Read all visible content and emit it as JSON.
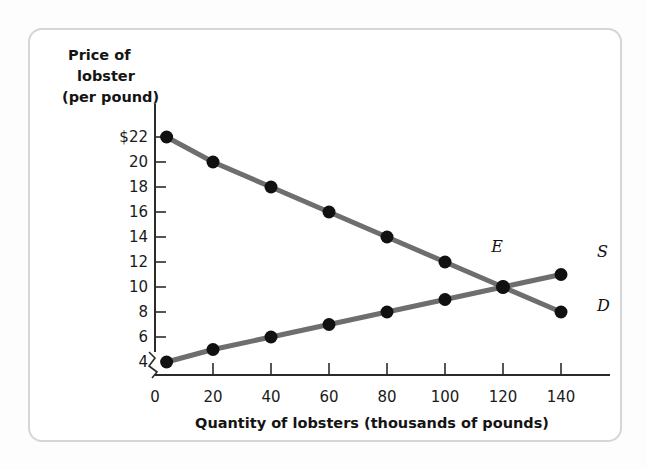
{
  "figure": {
    "background_color": "#ffffff",
    "frame_color": "#d6d6d6"
  },
  "chart_data": {
    "type": "line",
    "title": "",
    "xlabel": "Quantity of lobsters (thousands of pounds)",
    "ylabel": "Price of lobster (per pound)",
    "ylabel_lines": [
      "Price of",
      "lobster",
      "(per pound)"
    ],
    "xlim": [
      0,
      150
    ],
    "ylim": [
      3,
      23
    ],
    "grid": false,
    "axis_break_y": true,
    "legend_position": "inline-right",
    "x_ticks": [
      0,
      20,
      40,
      60,
      80,
      100,
      120,
      140
    ],
    "x_tick_labels": [
      "0",
      "20",
      "40",
      "60",
      "80",
      "100",
      "120",
      "140"
    ],
    "y_ticks": [
      4,
      6,
      8,
      10,
      12,
      14,
      16,
      18,
      20,
      22
    ],
    "y_tick_labels": [
      "4",
      "6",
      "8",
      "10",
      "12",
      "14",
      "16",
      "18",
      "20",
      "$22"
    ],
    "line_color": "#6e6e6e",
    "marker_color": "#111111",
    "series": [
      {
        "name": "D",
        "label": "D",
        "description": "Demand curve",
        "x": [
          4,
          20,
          40,
          60,
          80,
          100,
          120,
          140
        ],
        "values": [
          22,
          20,
          18,
          16,
          14,
          12,
          10,
          8
        ]
      },
      {
        "name": "S",
        "label": "S",
        "description": "Supply curve",
        "x": [
          4,
          20,
          40,
          60,
          80,
          100,
          120,
          140
        ],
        "values": [
          4,
          5,
          6,
          7,
          8,
          9,
          10,
          11
        ]
      }
    ],
    "annotations": [
      {
        "name": "equilibrium",
        "label": "E",
        "x": 120,
        "y": 10
      }
    ]
  }
}
